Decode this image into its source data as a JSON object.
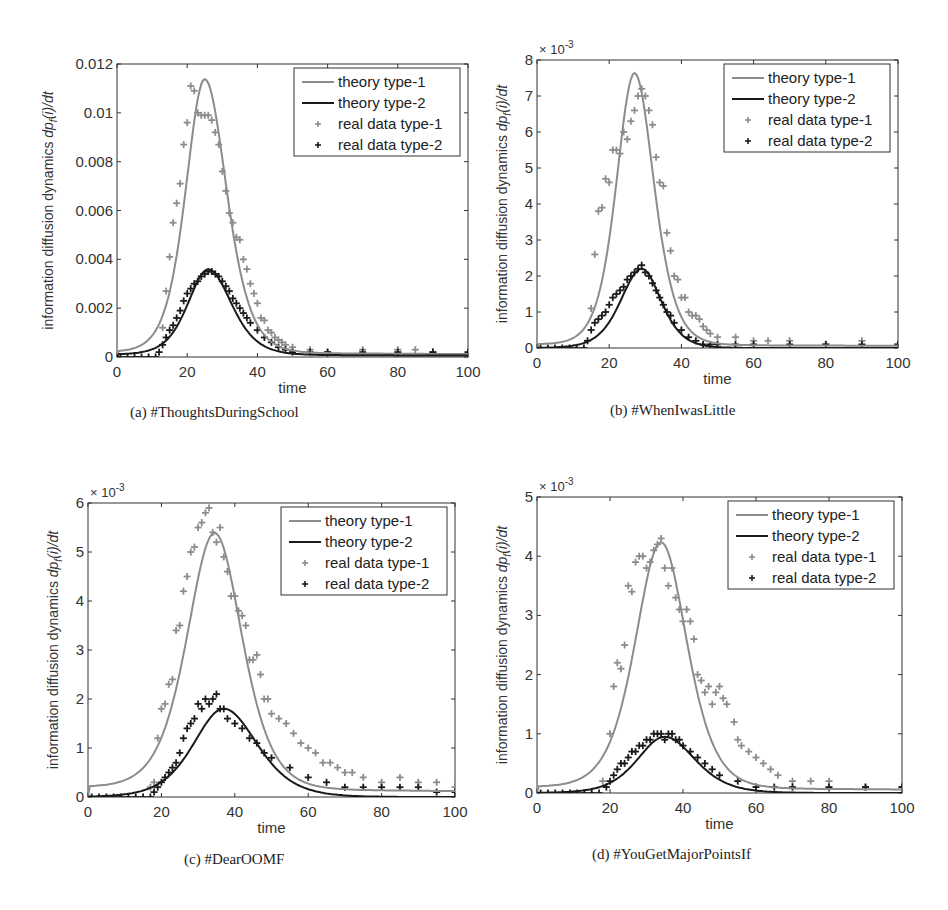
{
  "figure": {
    "colors": {
      "type1": "#8c8c8c",
      "type2": "#1a1a1a",
      "axis": "#333333"
    },
    "legend": [
      "theory type-1",
      "theory type-2",
      "real data type-1",
      "real data type-2"
    ],
    "footer_partial": ""
  },
  "chart_data": [
    {
      "id": "a",
      "type": "line",
      "caption": "(a)  #ThoughtsDuringSchool",
      "xlabel": "time",
      "ylabel": "information diffusion dynamics dp_f(i)/dt",
      "xlim": [
        0,
        100
      ],
      "ylim": [
        0,
        0.012
      ],
      "xticks": [
        0,
        20,
        40,
        60,
        80,
        100
      ],
      "yticks": [
        0,
        0.002,
        0.004,
        0.006,
        0.008,
        0.01,
        0.012
      ],
      "ytick_labels": [
        "0",
        "0.002",
        "0.004",
        "0.006",
        "0.008",
        "0.01",
        "0.012"
      ],
      "exponent": "",
      "series": [
        {
          "name": "theory type-1",
          "kind": "line",
          "peak_x": 25,
          "peak_y": 0.0112,
          "width_left": 6.5,
          "width_right": 7.5,
          "baseline": 0.0002
        },
        {
          "name": "theory type-2",
          "kind": "line",
          "peak_x": 26,
          "peak_y": 0.0035,
          "width_left": 7,
          "width_right": 8,
          "baseline": 0.0001
        },
        {
          "name": "real data type-1",
          "kind": "scatter",
          "x": [
            13,
            14,
            15,
            16,
            17,
            18,
            19,
            20,
            21,
            22,
            23,
            24,
            25,
            26,
            27,
            28,
            29,
            30,
            31,
            32,
            33,
            34,
            35,
            36,
            37,
            38,
            39,
            40,
            41,
            42,
            43,
            44,
            45,
            46,
            47,
            48,
            50,
            55,
            60,
            70,
            80,
            85,
            90
          ],
          "y": [
            0.0012,
            0.0027,
            0.0041,
            0.0055,
            0.0063,
            0.0071,
            0.0087,
            0.0096,
            0.0111,
            0.0109,
            0.01,
            0.0099,
            0.0099,
            0.0099,
            0.0097,
            0.0092,
            0.0087,
            0.0076,
            0.0068,
            0.0059,
            0.0055,
            0.0049,
            0.0048,
            0.004,
            0.0036,
            0.003,
            0.0026,
            0.0022,
            0.0016,
            0.0015,
            0.0011,
            0.001,
            0.0008,
            0.0007,
            0.0006,
            0.0005,
            0.0004,
            0.0003,
            0.0002,
            0.0003,
            0.0003,
            0.0003,
            0.0002
          ]
        },
        {
          "name": "real data type-2",
          "kind": "scatter",
          "x": [
            1,
            3,
            5,
            7,
            9,
            11,
            12,
            13,
            14,
            15,
            16,
            17,
            18,
            19,
            20,
            21,
            22,
            23,
            24,
            25,
            26,
            27,
            28,
            29,
            30,
            31,
            32,
            33,
            34,
            35,
            36,
            37,
            38,
            40,
            42,
            44,
            46,
            48,
            50,
            55,
            60,
            70,
            80,
            90,
            100
          ],
          "y": [
            0,
            0,
            0,
            0,
            0,
            0,
            0.0002,
            0.0005,
            0.0008,
            0.0011,
            0.0013,
            0.0016,
            0.0019,
            0.0023,
            0.0026,
            0.0028,
            0.003,
            0.0031,
            0.0033,
            0.0034,
            0.0035,
            0.0035,
            0.0034,
            0.0033,
            0.0031,
            0.0029,
            0.0027,
            0.0024,
            0.0022,
            0.002,
            0.0018,
            0.0016,
            0.0014,
            0.0011,
            0.0008,
            0.0006,
            0.0004,
            0.0003,
            0.0002,
            0.0002,
            0.0002,
            0.0002,
            0.0002,
            0.0002,
            0.0002
          ]
        }
      ],
      "legend_position": "upper right"
    },
    {
      "id": "b",
      "type": "line",
      "caption": "(b)  #WhenIwasLittle",
      "xlabel": "time",
      "ylabel": "information diffusion dynamics dp_f(i)/dt",
      "xlim": [
        0,
        100
      ],
      "ylim": [
        0,
        0.008
      ],
      "xticks": [
        0,
        20,
        40,
        60,
        80,
        100
      ],
      "yticks": [
        0,
        0.001,
        0.002,
        0.003,
        0.004,
        0.005,
        0.006,
        0.007,
        0.008
      ],
      "ytick_labels": [
        "0",
        "1",
        "2",
        "3",
        "4",
        "5",
        "6",
        "7",
        "8"
      ],
      "exponent": "× 10",
      "exponent_power": "-3",
      "series": [
        {
          "name": "theory type-1",
          "kind": "line",
          "peak_x": 27,
          "peak_y": 0.00755,
          "width_left": 6,
          "width_right": 6.5,
          "baseline": 0.0001
        },
        {
          "name": "theory type-2",
          "kind": "line",
          "peak_x": 29,
          "peak_y": 0.0022,
          "width_left": 7,
          "width_right": 6.5,
          "baseline": 0.0
        },
        {
          "name": "real data type-1",
          "kind": "scatter",
          "x": [
            15,
            16,
            17,
            18,
            19,
            20,
            21,
            22,
            23,
            24,
            25,
            26,
            27,
            28,
            29,
            30,
            31,
            32,
            33,
            34,
            35,
            36,
            37,
            38,
            39,
            40,
            41,
            42,
            43,
            44,
            45,
            46,
            47,
            48,
            50,
            55,
            60,
            64,
            70,
            80,
            90,
            100
          ],
          "y": [
            0.0011,
            0.0026,
            0.0038,
            0.0039,
            0.0047,
            0.0046,
            0.0055,
            0.0055,
            0.0054,
            0.006,
            0.0058,
            0.0063,
            0.0066,
            0.007,
            0.0072,
            0.007,
            0.0066,
            0.0062,
            0.0053,
            0.0046,
            0.0045,
            0.0032,
            0.0027,
            0.002,
            0.0019,
            0.0014,
            0.0014,
            0.001,
            0.0009,
            0.0009,
            0.0008,
            0.0006,
            0.0005,
            0.0004,
            0.0003,
            0.0003,
            0.0002,
            0.0002,
            0.0002,
            0.0001,
            0.0002,
            0.0001
          ]
        },
        {
          "name": "real data type-2",
          "kind": "scatter",
          "x": [
            1,
            3,
            5,
            7,
            9,
            11,
            13,
            14,
            15,
            16,
            17,
            18,
            19,
            20,
            21,
            22,
            23,
            24,
            25,
            26,
            27,
            28,
            29,
            30,
            31,
            32,
            33,
            34,
            35,
            36,
            37,
            38,
            40,
            42,
            44,
            46,
            48,
            50,
            55,
            60,
            70,
            80,
            90,
            100
          ],
          "y": [
            0,
            0,
            0,
            0,
            0,
            0,
            0,
            0.0002,
            0.0005,
            0.0007,
            0.0008,
            0.0009,
            0.001,
            0.0012,
            0.0014,
            0.0015,
            0.0016,
            0.0017,
            0.0019,
            0.002,
            0.0021,
            0.0022,
            0.0023,
            0.0021,
            0.002,
            0.0018,
            0.0016,
            0.0014,
            0.0012,
            0.001,
            0.0009,
            0.0007,
            0.0005,
            0.0003,
            0.0002,
            0.0001,
            0.0001,
            0.0001,
            0.0001,
            0.0001,
            0.0001,
            0.0001,
            0.0001,
            0.0001
          ]
        }
      ],
      "legend_position": "upper right"
    },
    {
      "id": "c",
      "type": "line",
      "caption": "(c)  #DearOOMF",
      "xlabel": "time",
      "ylabel": "information diffusion dynamics dp_f(i)/dt",
      "xlim": [
        0,
        100
      ],
      "ylim": [
        0,
        0.006
      ],
      "xticks": [
        0,
        20,
        40,
        60,
        80,
        100
      ],
      "yticks": [
        0,
        0.001,
        0.002,
        0.003,
        0.004,
        0.005,
        0.006
      ],
      "ytick_labels": [
        "0",
        "1",
        "2",
        "3",
        "4",
        "5",
        "6"
      ],
      "exponent": "× 10",
      "exponent_power": "-3",
      "series": [
        {
          "name": "theory type-1",
          "kind": "line",
          "peak_x": 34.5,
          "peak_y": 0.00522,
          "width_left": 9,
          "width_right": 9,
          "baseline": 0.0002
        },
        {
          "name": "theory type-2",
          "kind": "line",
          "peak_x": 37,
          "peak_y": 0.0018,
          "width_left": 10,
          "width_right": 11,
          "baseline": 0.0
        },
        {
          "name": "real data type-1",
          "kind": "scatter",
          "x": [
            17,
            18,
            19,
            20,
            21,
            22,
            23,
            24,
            25,
            26,
            27,
            28,
            29,
            30,
            31,
            32,
            33,
            34,
            35,
            36,
            37,
            38,
            39,
            40,
            41,
            42,
            43,
            44,
            45,
            46,
            47,
            48,
            49,
            50,
            52,
            54,
            56,
            58,
            60,
            62,
            64,
            66,
            68,
            70,
            72,
            75,
            80,
            85,
            90,
            95,
            100
          ],
          "y": [
            0.0002,
            0.0003,
            0.0012,
            0.0018,
            0.0019,
            0.0023,
            0.0024,
            0.0034,
            0.0035,
            0.0042,
            0.0045,
            0.005,
            0.0051,
            0.0055,
            0.0056,
            0.0058,
            0.0059,
            0.0054,
            0.0052,
            0.0055,
            0.0049,
            0.0046,
            0.0041,
            0.0041,
            0.0038,
            0.0037,
            0.0035,
            0.0028,
            0.0028,
            0.0029,
            0.0025,
            0.002,
            0.002,
            0.0017,
            0.0016,
            0.0015,
            0.0013,
            0.0011,
            0.001,
            0.0009,
            0.0007,
            0.0007,
            0.0006,
            0.0005,
            0.0005,
            0.0004,
            0.0003,
            0.0004,
            0.0003,
            0.0003,
            0.0002
          ]
        },
        {
          "name": "real data type-2",
          "kind": "scatter",
          "x": [
            1,
            3,
            5,
            7,
            9,
            11,
            13,
            15,
            17,
            18,
            19,
            20,
            21,
            22,
            23,
            24,
            25,
            26,
            27,
            28,
            29,
            30,
            31,
            32,
            33,
            34,
            35,
            36,
            37,
            38,
            40,
            42,
            44,
            46,
            48,
            50,
            55,
            60,
            65,
            70,
            75,
            80,
            85,
            90,
            95,
            100
          ],
          "y": [
            0,
            0,
            0,
            0,
            0,
            0,
            0,
            0,
            0,
            0.0001,
            0.0002,
            0.0003,
            0.0004,
            0.0005,
            0.0006,
            0.0007,
            0.0009,
            0.0012,
            0.0014,
            0.0015,
            0.0016,
            0.0019,
            0.0018,
            0.002,
            0.0019,
            0.002,
            0.0021,
            0.0018,
            0.0018,
            0.0016,
            0.0015,
            0.0014,
            0.0012,
            0.0011,
            0.0009,
            0.0008,
            0.0006,
            0.0004,
            0.0003,
            0.0002,
            0.0002,
            0.0002,
            0.0002,
            0.0002,
            0.0001,
            0.0001
          ]
        }
      ],
      "legend_position": "upper right"
    },
    {
      "id": "d",
      "type": "line",
      "caption": "(d)  #YouGetMajorPointsIf",
      "xlabel": "time",
      "ylabel": "information diffusion dynamics dp_f(i)/dt",
      "xlim": [
        0,
        100
      ],
      "ylim": [
        0,
        0.005
      ],
      "xticks": [
        0,
        20,
        40,
        60,
        80,
        100
      ],
      "yticks": [
        0,
        0.001,
        0.002,
        0.003,
        0.004,
        0.005
      ],
      "ytick_labels": [
        "0",
        "1",
        "2",
        "3",
        "4",
        "5"
      ],
      "exponent": "× 10",
      "exponent_power": "-3",
      "series": [
        {
          "name": "theory type-1",
          "kind": "line",
          "peak_x": 34,
          "peak_y": 0.00415,
          "width_left": 8.5,
          "width_right": 8.5,
          "baseline": 0.0001
        },
        {
          "name": "theory type-2",
          "kind": "line",
          "peak_x": 35,
          "peak_y": 0.00095,
          "width_left": 9,
          "width_right": 10,
          "baseline": 0.0
        },
        {
          "name": "real data type-1",
          "kind": "scatter",
          "x": [
            18,
            20,
            21,
            22,
            23,
            24,
            25,
            26,
            27,
            28,
            29,
            30,
            31,
            32,
            33,
            34,
            35,
            36,
            37,
            38,
            39,
            40,
            41,
            42,
            43,
            44,
            45,
            46,
            47,
            48,
            49,
            50,
            51,
            52,
            54,
            55,
            56,
            58,
            60,
            62,
            64,
            66,
            70,
            75,
            80,
            90,
            100
          ],
          "y": [
            0.0002,
            0.001,
            0.0018,
            0.0022,
            0.0021,
            0.0025,
            0.0035,
            0.0034,
            0.0039,
            0.004,
            0.004,
            0.0038,
            0.0039,
            0.0041,
            0.0042,
            0.0043,
            0.0038,
            0.0035,
            0.0038,
            0.0033,
            0.0031,
            0.0029,
            0.0031,
            0.0029,
            0.0026,
            0.002,
            0.0019,
            0.0017,
            0.0018,
            0.0015,
            0.0017,
            0.0018,
            0.0016,
            0.0015,
            0.0012,
            0.0009,
            0.0008,
            0.0007,
            0.0006,
            0.0005,
            0.0004,
            0.0003,
            0.0002,
            0.0002,
            0.0002,
            0.0001,
            0.0001
          ]
        },
        {
          "name": "real data type-2",
          "kind": "scatter",
          "x": [
            1,
            3,
            5,
            7,
            9,
            11,
            13,
            15,
            17,
            19,
            20,
            21,
            22,
            23,
            24,
            25,
            26,
            27,
            28,
            29,
            30,
            31,
            32,
            33,
            34,
            35,
            36,
            37,
            38,
            39,
            40,
            42,
            44,
            46,
            48,
            50,
            55,
            60,
            65,
            70,
            80,
            90,
            100
          ],
          "y": [
            0,
            0,
            0,
            0,
            0,
            0,
            0,
            0,
            0,
            0.0001,
            0.0002,
            0.0003,
            0.0004,
            0.0005,
            0.0005,
            0.0006,
            0.0007,
            0.0007,
            0.0008,
            0.0008,
            0.0009,
            0.0009,
            0.001,
            0.001,
            0.001,
            0.0009,
            0.001,
            0.001,
            0.0009,
            0.0009,
            0.0008,
            0.0007,
            0.0006,
            0.0005,
            0.0004,
            0.0003,
            0.0002,
            0.0001,
            0.0001,
            0.0001,
            0.0001,
            0.0001,
            0.0001
          ]
        }
      ],
      "legend_position": "upper right"
    }
  ]
}
